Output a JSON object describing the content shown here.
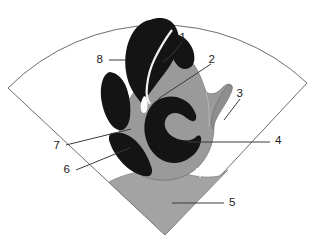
{
  "figure": {
    "sector_outline_color": "#6e6e6e",
    "dark_tissue_color": "#141414",
    "gray_tissue_color": "#9a9a9a",
    "light_gray_color": "#a3a3a3",
    "leader_line_color": "#3a3a3a",
    "background_color": "#ffffff",
    "text_color": "#1a1a1a"
  },
  "labels": [
    {
      "id": "label-1",
      "text": "1",
      "x": 186,
      "y": 38
    },
    {
      "id": "label-2",
      "text": "2",
      "x": 215,
      "y": 60
    },
    {
      "id": "label-3",
      "text": "3",
      "x": 243,
      "y": 94
    },
    {
      "id": "label-4",
      "text": "4",
      "x": 275,
      "y": 141
    },
    {
      "id": "label-5",
      "text": "5",
      "x": 229,
      "y": 203
    },
    {
      "id": "label-6",
      "text": "6",
      "x": 70,
      "y": 170
    },
    {
      "id": "label-7",
      "text": "7",
      "x": 60,
      "y": 146
    },
    {
      "id": "label-8",
      "text": "8",
      "x": 103,
      "y": 60
    }
  ],
  "leaders": [
    {
      "id": "leader-1",
      "points": "182,42 172,55 163,62"
    },
    {
      "id": "leader-2",
      "points": "211,64 158,99"
    },
    {
      "id": "leader-3",
      "points": "240,99 224,120"
    },
    {
      "id": "leader-4",
      "points": "270,142 188,142"
    },
    {
      "id": "leader-5",
      "points": "224,203 172,203"
    },
    {
      "id": "leader-6",
      "points": "76,170 130,148"
    },
    {
      "id": "leader-7",
      "points": "66,145 131,129"
    },
    {
      "id": "leader-8",
      "points": "109,60 126,60"
    }
  ]
}
